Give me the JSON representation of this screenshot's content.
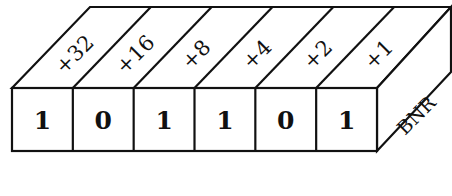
{
  "diagram": {
    "type": "binary-register-block",
    "side_label": "BNR",
    "cells": [
      {
        "weight": "+32",
        "bit": "1"
      },
      {
        "weight": "+16",
        "bit": "0"
      },
      {
        "weight": "+8",
        "bit": "1"
      },
      {
        "weight": "+4",
        "bit": "1"
      },
      {
        "weight": "+2",
        "bit": "0"
      },
      {
        "weight": "+1",
        "bit": "1"
      }
    ],
    "colors": {
      "stroke": "#111111",
      "background": "#ffffff"
    }
  }
}
